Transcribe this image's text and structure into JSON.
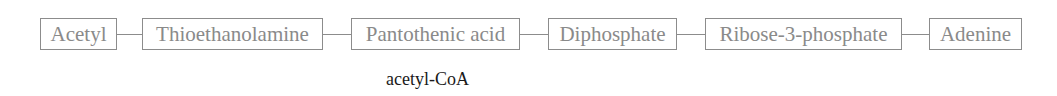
{
  "diagram": {
    "type": "linear-chain",
    "nodes": [
      {
        "label": "Acetyl"
      },
      {
        "label": "Thioethanolamine"
      },
      {
        "label": "Pantothenic acid"
      },
      {
        "label": "Diphosphate"
      },
      {
        "label": "Ribose-3-phosphate"
      },
      {
        "label": "Adenine"
      }
    ],
    "edges": [
      {
        "from": "Acetyl",
        "to": "Thioethanolamine"
      },
      {
        "from": "Thioethanolamine",
        "to": "Pantothenic acid"
      },
      {
        "from": "Pantothenic acid",
        "to": "Diphosphate"
      },
      {
        "from": "Diphosphate",
        "to": "Ribose-3-phosphate"
      },
      {
        "from": "Ribose-3-phosphate",
        "to": "Adenine"
      }
    ],
    "caption": "acetyl-CoA",
    "colors": {
      "box_border": "#8c8c8c",
      "box_text": "#8a8a8a",
      "caption_text": "#1a1a1a"
    }
  }
}
